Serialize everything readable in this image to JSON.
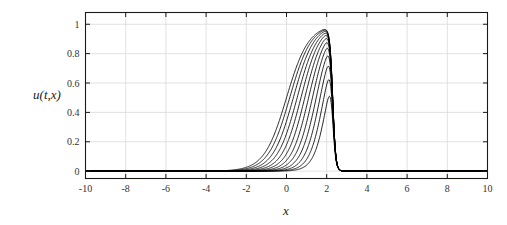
{
  "figure": {
    "name": "traveling-wave-evolution-plot",
    "background_color": "#ffffff",
    "axes_color": "#1a1a1a",
    "grid_color": "#d9d9d9",
    "curve_color": "#000000"
  },
  "chart_data": {
    "type": "line",
    "title": "",
    "subtitle": "",
    "xlabel": "x",
    "ylabel": "u(t,x)",
    "xlim": [
      -10,
      10
    ],
    "ylim": [
      -0.05,
      1.08
    ],
    "xticks": [
      -10,
      -8,
      -6,
      -4,
      -2,
      0,
      2,
      4,
      6,
      8,
      10
    ],
    "xticklabels": [
      "-10",
      "-8",
      "-6",
      "-4",
      "-2",
      "0",
      "2",
      "4",
      "6",
      "8",
      "10"
    ],
    "yticks": [
      0,
      0.2,
      0.4,
      0.6,
      0.8,
      1
    ],
    "yticklabels": [
      "0",
      "0.2",
      "0.4",
      "0.6",
      "0.8",
      "1"
    ],
    "grid": true,
    "legend": null,
    "legend_position": "none",
    "annotations": [],
    "series_count": 12,
    "series": [
      {
        "name": "t = 0",
        "plateau_left": 2.05,
        "plateau_right": 2.3,
        "left_width": 1.0,
        "right_width": 0.22
      },
      {
        "name": "t = 1",
        "plateau_left": 1.86,
        "plateau_right": 2.3,
        "left_width": 1.06,
        "right_width": 0.22
      },
      {
        "name": "t = 2",
        "plateau_left": 1.67,
        "plateau_right": 2.3,
        "left_width": 1.12,
        "right_width": 0.22
      },
      {
        "name": "t = 3",
        "plateau_left": 1.48,
        "plateau_right": 2.3,
        "left_width": 1.18,
        "right_width": 0.22
      },
      {
        "name": "t = 4",
        "plateau_left": 1.29,
        "plateau_right": 2.3,
        "left_width": 1.24,
        "right_width": 0.22
      },
      {
        "name": "t = 5",
        "plateau_left": 1.1,
        "plateau_right": 2.3,
        "left_width": 1.3,
        "right_width": 0.22
      },
      {
        "name": "t = 6",
        "plateau_left": 0.91,
        "plateau_right": 2.3,
        "left_width": 1.36,
        "right_width": 0.22
      },
      {
        "name": "t = 7",
        "plateau_left": 0.72,
        "plateau_right": 2.3,
        "left_width": 1.42,
        "right_width": 0.22
      },
      {
        "name": "t = 8",
        "plateau_left": 0.53,
        "plateau_right": 2.3,
        "left_width": 1.48,
        "right_width": 0.22
      },
      {
        "name": "t = 9",
        "plateau_left": 0.34,
        "plateau_right": 2.3,
        "left_width": 1.54,
        "right_width": 0.22
      },
      {
        "name": "t = 10",
        "plateau_left": 0.16,
        "plateau_right": 2.3,
        "left_width": 1.6,
        "right_width": 0.22
      },
      {
        "name": "t = 11",
        "plateau_left": 0.0,
        "plateau_right": 2.3,
        "left_width": 1.66,
        "right_width": 0.22
      }
    ],
    "baseline": {
      "name": "far-field",
      "value": 0.0
    }
  }
}
